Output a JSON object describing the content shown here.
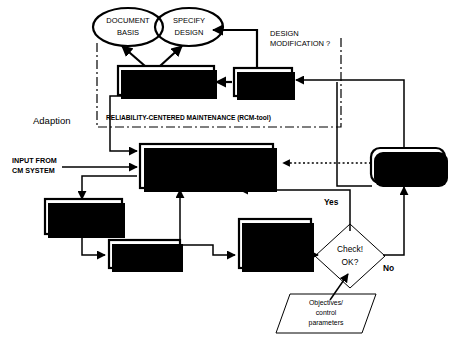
{
  "diagram": {
    "background": "#ffffff",
    "line_color": "#000000"
  },
  "nodes": {
    "document_basis": {
      "line1": "DOCUMENT",
      "line2": "BASIS",
      "shape": "ellipse"
    },
    "specify_design": {
      "line1": "SPECIFY",
      "line2": "DESIGN",
      "shape": "ellipse"
    },
    "maintenance_requirements": {
      "line1": "MAINTENANCE",
      "line2": "REQUIREMENTS",
      "shape": "rect"
    },
    "rcm_analysis": {
      "line1": "RCM",
      "line2": "ANALYSIS",
      "shape": "rect"
    },
    "implementation": {
      "line1": "IMPLEMENTATION IN",
      "line2": "MAINTENANCE",
      "line3": "MANAGEMENT SYSTEM",
      "shape": "rect"
    },
    "improvement_actions": {
      "line1": "Improvement",
      "line2": "action(s)",
      "shape": "rounded-rect"
    },
    "perform_maintenance": {
      "line1": "PERFORM",
      "line2": "MAINTENANCE",
      "shape": "rect"
    },
    "report_to_mms": {
      "line1": "Report to MMS",
      "shape": "rect"
    },
    "reports_from": {
      "line1": "REPORTS FROM",
      "line2": "MAINTENANCE/",
      "line3": "OPERATION",
      "shape": "rect"
    },
    "check_ok": {
      "line1": "Check!",
      "line2": "OK?",
      "shape": "diamond"
    },
    "objectives": {
      "line1": "Objectives/",
      "line2": "control",
      "line3": "parameters",
      "shape": "parallelogram"
    }
  },
  "labels": {
    "design_modification": {
      "line1": "DESIGN",
      "line2": "MODIFICATION ?"
    },
    "rcm_tool_boundary": "RELIABILITY-CENTERED MAINTENANCE (RCM-tool)",
    "adaption": "Adaption",
    "input_from_cm": {
      "line1": "INPUT FROM",
      "line2": "CM SYSTEM"
    },
    "yes": "Yes",
    "no": "No"
  }
}
